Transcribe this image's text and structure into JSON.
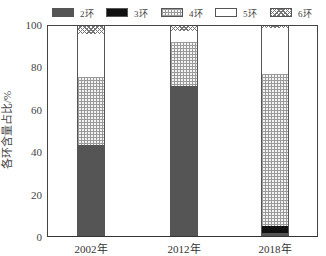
{
  "chart_data": {
    "type": "bar",
    "stacked": true,
    "title": "",
    "xlabel": "",
    "ylabel": "各环含量占比/%",
    "ylim": [
      0,
      100
    ],
    "yticks": [
      "0",
      "20",
      "40",
      "60",
      "80",
      "100"
    ],
    "categories": [
      "2002年",
      "2012年",
      "2018年"
    ],
    "series": [
      {
        "name": "2环",
        "key": "r2",
        "color": "#555555",
        "pattern": "solid-dark-gray",
        "values": [
          43.5,
          71.5,
          1.5
        ]
      },
      {
        "name": "3环",
        "key": "r3",
        "color": "#111111",
        "pattern": "solid-black",
        "values": [
          0,
          0,
          3.5
        ]
      },
      {
        "name": "4环",
        "key": "r4",
        "color": "#9a9a9a",
        "pattern": "grid",
        "values": [
          32,
          21,
          72
        ]
      },
      {
        "name": "5环",
        "key": "r5",
        "color": "#ffffff",
        "pattern": "white",
        "values": [
          20.5,
          5,
          22
        ]
      },
      {
        "name": "6环",
        "key": "r6",
        "color": "#777777",
        "pattern": "cross-hatch",
        "values": [
          4,
          2.5,
          1
        ]
      }
    ],
    "grid": false,
    "legend_position": "top"
  },
  "legend": {
    "items": [
      {
        "label": "2环",
        "key": "r2"
      },
      {
        "label": "3环",
        "key": "r3"
      },
      {
        "label": "4环",
        "key": "r4"
      },
      {
        "label": "5环",
        "key": "r5"
      },
      {
        "label": "6环",
        "key": "r6"
      }
    ]
  },
  "axes": {
    "ylabel": "各环含量占比/%",
    "yticks": [
      "0",
      "20",
      "40",
      "60",
      "80",
      "100"
    ],
    "xticks": [
      "2002年",
      "2012年",
      "2018年"
    ]
  }
}
